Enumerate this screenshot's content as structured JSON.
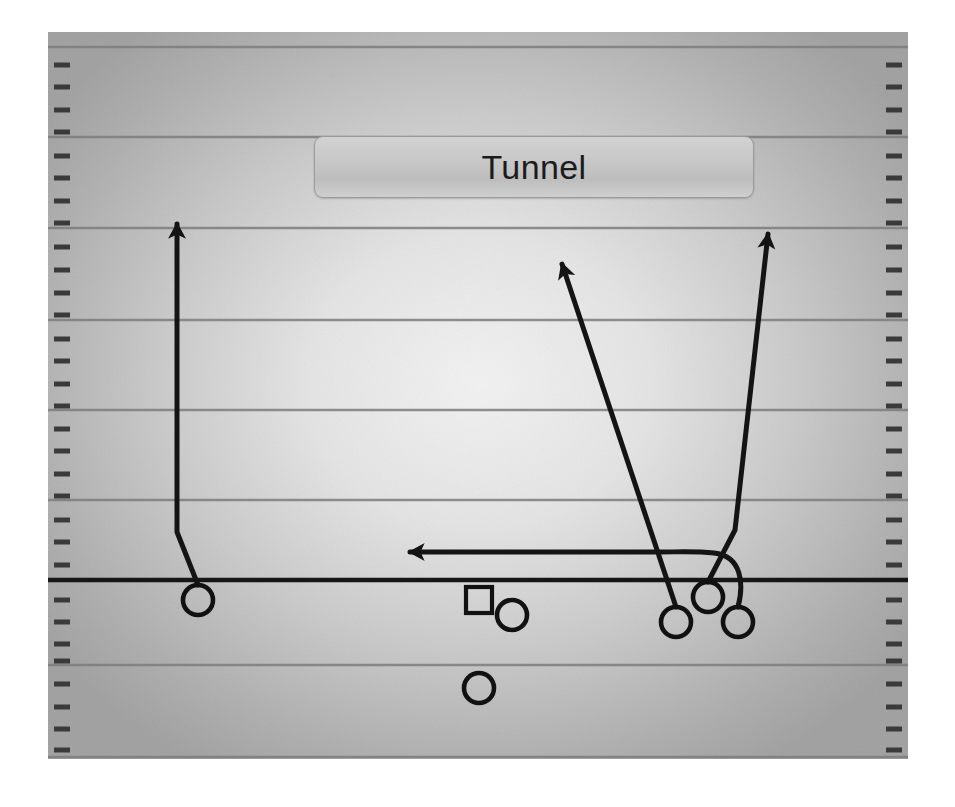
{
  "diagram": {
    "title": "Tunnel",
    "type": "american-football-play-diagram",
    "sport": "American Football",
    "colors": {
      "field_light": "#ededed",
      "field_mid": "#c9c9c9",
      "field_dark": "#a8a8a8",
      "yard_line": "#7a7a7a",
      "line_of_scrimmage": "#1a1a1a",
      "hash_mark": "#3d3d3d",
      "route_stroke": "#141414",
      "player_stroke": "#111111",
      "title_text": "#1b1b1b",
      "title_box_border": "#9a9a9a",
      "page_background": "#ffffff"
    },
    "field": {
      "x": 0,
      "y": 0,
      "width": 860,
      "height": 727,
      "yard_lines_y": [
        15,
        105,
        196,
        288,
        378,
        468,
        633,
        726
      ],
      "line_of_scrimmage_y": 548,
      "hash_mark_count_per_side": 32,
      "hash_spacing": 22.6,
      "hash_length": 16,
      "sideline_margin": 6
    },
    "players": [
      {
        "id": "X",
        "label": "split-end-left",
        "marker": "circle",
        "cx": 150,
        "cy": 568,
        "r": 15
      },
      {
        "id": "C",
        "label": "center",
        "marker": "square",
        "cx": 431,
        "cy": 568,
        "size": 26
      },
      {
        "id": "QB",
        "label": "quarterback",
        "marker": "circle",
        "cx": 464,
        "cy": 583,
        "r": 15
      },
      {
        "id": "RB",
        "label": "running-back",
        "marker": "circle",
        "cx": 431,
        "cy": 656,
        "r": 15
      },
      {
        "id": "Y",
        "label": "inside-right-wide",
        "marker": "circle",
        "cx": 628,
        "cy": 590,
        "r": 15
      },
      {
        "id": "H",
        "label": "slot-right-up",
        "marker": "circle",
        "cx": 660,
        "cy": 565,
        "r": 15
      },
      {
        "id": "Z",
        "label": "flanker-right",
        "marker": "circle",
        "cx": 690,
        "cy": 590,
        "r": 15
      }
    ],
    "routes": [
      {
        "id": "route-x-go",
        "label": "left-receiver-vertical-release",
        "player": "X",
        "description": "Release inside then vertical go route upfield",
        "arrowhead": true,
        "points": [
          [
            150,
            553
          ],
          [
            129,
            500
          ],
          [
            129,
            186
          ]
        ]
      },
      {
        "id": "route-y-post",
        "label": "inside-receiver-deep-over",
        "player": "Y",
        "description": "Deep crossing / post route breaking up and to the left",
        "arrowhead": true,
        "points": [
          [
            628,
            575
          ],
          [
            512,
            226
          ]
        ]
      },
      {
        "id": "route-h-seam",
        "label": "slot-receiver-seam",
        "player": "H",
        "description": "Seam route stemming outside then vertical",
        "arrowhead": true,
        "points": [
          [
            660,
            550
          ],
          [
            687,
            498
          ],
          [
            720,
            196
          ]
        ]
      },
      {
        "id": "route-z-drag",
        "label": "flanker-shallow-drag",
        "player": "Z",
        "description": "Shallow drag across the formation to the left",
        "arrowhead": true,
        "curve": true,
        "points": [
          [
            690,
            575
          ],
          [
            700,
            545
          ],
          [
            672,
            520
          ],
          [
            620,
            520
          ],
          [
            355,
            520
          ]
        ]
      }
    ],
    "annotations": {
      "arrowhead_width": 18,
      "arrowhead_length": 22,
      "route_stroke_width": 5
    }
  }
}
